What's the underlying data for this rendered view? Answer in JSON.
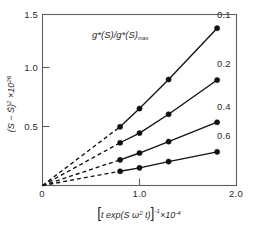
{
  "chart_data": {
    "type": "line",
    "title": "",
    "annotation": "g*(S)/g*(S)max",
    "annotation_parts": {
      "main": "g*(S)/g*(S)",
      "subscript": "max"
    },
    "xlabel": "[t exp(S ω² t)]⁻¹ ×10⁻⁴",
    "xlabel_parts": {
      "bracket_open": "[",
      "body": "t exp(S ω",
      "omega_sup": "2",
      "body_tail": " t)",
      "bracket_close": "]",
      "bracket_sup": "-1",
      "multiplier": "×10",
      "multiplier_sup": "-4"
    },
    "ylabel": "(S - S̄)² ×10²⁶",
    "ylabel_parts": {
      "body": "(S − S̄)",
      "body_sup": "2",
      "multiplier": " ×10",
      "multiplier_sup": "26"
    },
    "xlim": [
      0,
      2.0
    ],
    "ylim": [
      0,
      1.5
    ],
    "xticks": [
      0,
      1.0,
      2.0
    ],
    "xtick_labels": [
      "0",
      "1.0",
      "2.0"
    ],
    "yticks": [
      0.5,
      1.0,
      1.5
    ],
    "ytick_labels": [
      "0.5",
      "1.0",
      "1.5"
    ],
    "grid": false,
    "legend_position": "inline-right-of-curve-end",
    "series": [
      {
        "name": "0.1",
        "label": "0.1",
        "label_x": 1.87,
        "label_y": 1.47,
        "x": [
          0.8,
          1.0,
          1.3,
          1.8
        ],
        "y": [
          0.515,
          0.675,
          0.93,
          1.38
        ],
        "extrapolated_from": [
          0.0,
          0.0
        ]
      },
      {
        "name": "0.2",
        "label": "0.2",
        "label_x": 1.87,
        "label_y": 1.04,
        "x": [
          0.8,
          1.0,
          1.3,
          1.8
        ],
        "y": [
          0.375,
          0.46,
          0.625,
          0.925
        ],
        "extrapolated_from": [
          0.0,
          0.0
        ]
      },
      {
        "name": "0.4",
        "label": "0.4",
        "label_x": 1.87,
        "label_y": 0.66,
        "x": [
          0.8,
          1.0,
          1.3,
          1.8
        ],
        "y": [
          0.225,
          0.285,
          0.385,
          0.555
        ],
        "extrapolated_from": [
          0.0,
          0.0
        ]
      },
      {
        "name": "0.6",
        "label": "0.6",
        "label_x": 1.87,
        "label_y": 0.405,
        "x": [
          0.8,
          1.0,
          1.3,
          1.8
        ],
        "y": [
          0.125,
          0.155,
          0.21,
          0.295
        ],
        "extrapolated_from": [
          0.0,
          0.0
        ]
      }
    ]
  }
}
